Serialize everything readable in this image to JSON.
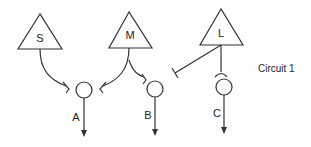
{
  "diagram": {
    "title": "Circuit 1",
    "inputs": [
      {
        "id": "S",
        "label": "S"
      },
      {
        "id": "M",
        "label": "M"
      },
      {
        "id": "L",
        "label": "L"
      }
    ],
    "outputs": [
      {
        "id": "A",
        "label": "A"
      },
      {
        "id": "B",
        "label": "B"
      },
      {
        "id": "C",
        "label": "C"
      }
    ],
    "connections": [
      {
        "from": "S",
        "to": "A",
        "type": "excitatory"
      },
      {
        "from": "M",
        "to": "A",
        "type": "excitatory"
      },
      {
        "from": "M",
        "to": "B",
        "type": "excitatory"
      },
      {
        "from": "L",
        "to": "B",
        "type": "inhibitory"
      },
      {
        "from": "L",
        "to": "C",
        "type": "excitatory"
      }
    ]
  }
}
